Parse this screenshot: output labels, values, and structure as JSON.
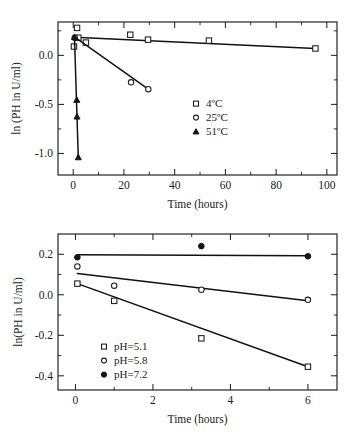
{
  "figure": {
    "panels": [
      "top",
      "bottom"
    ]
  },
  "chart_data": [
    {
      "id": "thermal-stability",
      "type": "scatter",
      "title": "",
      "xlabel": "Time (hours)",
      "ylabel": "ln (PH in U/ml)",
      "xlim": [
        -6,
        104
      ],
      "ylim": [
        -1.22,
        0.34
      ],
      "xticks": [
        0,
        20,
        40,
        60,
        80,
        100
      ],
      "xticklabels": [
        "0",
        "20",
        "40",
        "60",
        "80",
        "100"
      ],
      "yticks": [
        0.0,
        -0.5,
        -1.0
      ],
      "yticklabels": [
        "0.0",
        "-0.5",
        "-1.0"
      ],
      "grid": false,
      "legend_position": "center-right",
      "series": [
        {
          "name": "4ºC",
          "marker": "open-square",
          "x": [
            0.3,
            1.5,
            2.0,
            5.0,
            22.5,
            29.5,
            53.5,
            95.5
          ],
          "y": [
            0.09,
            0.28,
            0.18,
            0.13,
            0.21,
            0.16,
            0.15,
            0.07
          ],
          "fit": {
            "x": [
              0.5,
              95.5
            ],
            "y": [
              0.185,
              0.07
            ]
          }
        },
        {
          "name": "25ºC",
          "marker": "open-circle",
          "x": [
            0.6,
            22.8,
            29.6
          ],
          "y": [
            0.18,
            -0.275,
            -0.345
          ],
          "fit": {
            "x": [
              0.6,
              29.6
            ],
            "y": [
              0.185,
              -0.345
            ]
          }
        },
        {
          "name": "51ºC",
          "marker": "filled-triangle",
          "x": [
            0.5,
            1.4,
            1.5,
            2.0
          ],
          "y": [
            0.185,
            -0.455,
            -0.625,
            -1.04
          ],
          "fit": {
            "x": [
              0.5,
              2.0
            ],
            "y": [
              0.185,
              -1.04
            ]
          }
        }
      ]
    },
    {
      "id": "ph-stability",
      "type": "scatter",
      "title": "",
      "xlabel": "Time (hours)",
      "ylabel": "ln(PH in U/ml)",
      "xlim": [
        -0.45,
        6.75
      ],
      "ylim": [
        -0.47,
        0.3
      ],
      "xticks": [
        0,
        2,
        4,
        6
      ],
      "xticklabels": [
        "0",
        "2",
        "4",
        "6"
      ],
      "yticks": [
        0.2,
        0.0,
        -0.2,
        -0.4
      ],
      "yticklabels": [
        "0.2",
        "0.0",
        "-0.2",
        "-0.4"
      ],
      "grid": false,
      "legend_position": "lower-left",
      "series": [
        {
          "name": "pH=5.1",
          "marker": "open-square",
          "x": [
            0.05,
            1.0,
            3.25,
            6.0
          ],
          "y": [
            0.055,
            -0.03,
            -0.215,
            -0.355
          ],
          "fit": {
            "x": [
              0.05,
              6.0
            ],
            "y": [
              0.055,
              -0.355
            ]
          }
        },
        {
          "name": "pH=5.8",
          "marker": "open-circle",
          "x": [
            0.05,
            1.0,
            3.25,
            6.0
          ],
          "y": [
            0.14,
            0.045,
            0.025,
            -0.025
          ],
          "fit": {
            "x": [
              0.05,
              6.0
            ],
            "y": [
              0.105,
              -0.03
            ]
          }
        },
        {
          "name": "pH=7.2",
          "marker": "filled-circle",
          "x": [
            0.05,
            3.25,
            6.0
          ],
          "y": [
            0.185,
            0.24,
            0.19
          ],
          "fit": {
            "x": [
              0.05,
              6.0
            ],
            "y": [
              0.197,
              0.193
            ]
          }
        }
      ]
    }
  ]
}
